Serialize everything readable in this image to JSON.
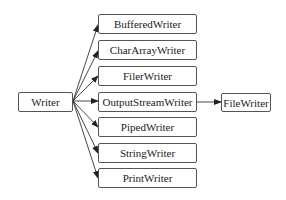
{
  "diagram": {
    "root": {
      "label": "Writer"
    },
    "children": [
      {
        "label": "BufferedWriter"
      },
      {
        "label": "CharArrayWriter"
      },
      {
        "label": "FilerWriter"
      },
      {
        "label": "OutputStreamWriter"
      },
      {
        "label": "PipedWriter"
      },
      {
        "label": "StringWriter"
      },
      {
        "label": "PrintWriter"
      }
    ],
    "grandchild": {
      "label": "FileWriter",
      "parent": "OutputStreamWriter"
    },
    "colors": {
      "border": "#555555",
      "arrow": "#222222",
      "background": "#ffffff"
    }
  }
}
